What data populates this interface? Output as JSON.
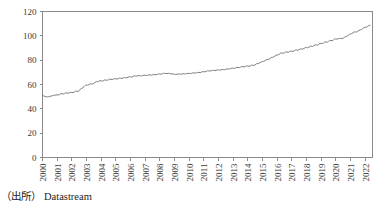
{
  "source_note": {
    "label": "（出所）",
    "text": "Datastream"
  },
  "chart_data": {
    "type": "line",
    "title": "",
    "xlabel": "",
    "ylabel": "",
    "ylim": [
      0,
      120
    ],
    "yticks": [
      0,
      20,
      40,
      60,
      80,
      100,
      120
    ],
    "ytick_labels": [
      "0",
      "20",
      "40",
      "60",
      "80",
      "100",
      "120"
    ],
    "xlim": [
      2000,
      2022.5
    ],
    "xticks": [
      2000,
      2001,
      2002,
      2003,
      2004,
      2005,
      2006,
      2007,
      2008,
      2009,
      2010,
      2011,
      2012,
      2013,
      2014,
      2015,
      2016,
      2017,
      2018,
      2019,
      2020,
      2021,
      2022
    ],
    "xtick_labels": [
      "2000",
      "2001",
      "2002",
      "2003",
      "2004",
      "2005",
      "2006",
      "2007",
      "2008",
      "2009",
      "2010",
      "2011",
      "2012",
      "2013",
      "2014",
      "2015",
      "2016",
      "2017",
      "2018",
      "2019",
      "2020",
      "2021",
      "2022"
    ],
    "xtick_rotation": 90,
    "grid": false,
    "legend": null,
    "line_color": "#6e6e6e",
    "axis_color": "#8a8a8a",
    "series": [
      {
        "name": "index",
        "x": [
          2000.0,
          2000.08,
          2000.17,
          2000.25,
          2000.33,
          2000.42,
          2000.5,
          2000.58,
          2000.67,
          2000.75,
          2000.83,
          2000.92,
          2001.0,
          2001.08,
          2001.17,
          2001.25,
          2001.33,
          2001.42,
          2001.5,
          2001.58,
          2001.67,
          2001.75,
          2001.83,
          2001.92,
          2002.0,
          2002.08,
          2002.17,
          2002.25,
          2002.33,
          2002.42,
          2002.5,
          2002.58,
          2002.67,
          2002.75,
          2002.83,
          2002.92,
          2003.0,
          2003.08,
          2003.17,
          2003.25,
          2003.33,
          2003.42,
          2003.5,
          2003.58,
          2003.67,
          2003.75,
          2003.83,
          2003.92,
          2004.0,
          2004.08,
          2004.17,
          2004.25,
          2004.33,
          2004.42,
          2004.5,
          2004.58,
          2004.67,
          2004.75,
          2004.83,
          2004.92,
          2005.0,
          2005.08,
          2005.17,
          2005.25,
          2005.33,
          2005.42,
          2005.5,
          2005.58,
          2005.67,
          2005.75,
          2005.83,
          2005.92,
          2006.0,
          2006.08,
          2006.17,
          2006.25,
          2006.33,
          2006.42,
          2006.5,
          2006.58,
          2006.67,
          2006.75,
          2006.83,
          2006.92,
          2007.0,
          2007.08,
          2007.17,
          2007.25,
          2007.33,
          2007.42,
          2007.5,
          2007.58,
          2007.67,
          2007.75,
          2007.83,
          2007.92,
          2008.0,
          2008.08,
          2008.17,
          2008.25,
          2008.33,
          2008.42,
          2008.5,
          2008.58,
          2008.67,
          2008.75,
          2008.83,
          2008.92,
          2009.0,
          2009.08,
          2009.17,
          2009.25,
          2009.33,
          2009.42,
          2009.5,
          2009.58,
          2009.67,
          2009.75,
          2009.83,
          2009.92,
          2010.0,
          2010.08,
          2010.17,
          2010.25,
          2010.33,
          2010.42,
          2010.5,
          2010.58,
          2010.67,
          2010.75,
          2010.83,
          2010.92,
          2011.0,
          2011.08,
          2011.17,
          2011.25,
          2011.33,
          2011.42,
          2011.5,
          2011.58,
          2011.67,
          2011.75,
          2011.83,
          2011.92,
          2012.0,
          2012.08,
          2012.17,
          2012.25,
          2012.33,
          2012.42,
          2012.5,
          2012.58,
          2012.67,
          2012.75,
          2012.83,
          2012.92,
          2013.0,
          2013.08,
          2013.17,
          2013.25,
          2013.33,
          2013.42,
          2013.5,
          2013.58,
          2013.67,
          2013.75,
          2013.83,
          2013.92,
          2014.0,
          2014.08,
          2014.17,
          2014.25,
          2014.33,
          2014.42,
          2014.5,
          2014.58,
          2014.67,
          2014.75,
          2014.83,
          2014.92,
          2015.0,
          2015.08,
          2015.17,
          2015.25,
          2015.33,
          2015.42,
          2015.5,
          2015.58,
          2015.67,
          2015.75,
          2015.83,
          2015.92,
          2016.0,
          2016.08,
          2016.17,
          2016.25,
          2016.33,
          2016.42,
          2016.5,
          2016.58,
          2016.67,
          2016.75,
          2016.83,
          2016.92,
          2017.0,
          2017.08,
          2017.17,
          2017.25,
          2017.33,
          2017.42,
          2017.5,
          2017.58,
          2017.67,
          2017.75,
          2017.83,
          2017.92,
          2018.0,
          2018.08,
          2018.17,
          2018.25,
          2018.33,
          2018.42,
          2018.5,
          2018.58,
          2018.67,
          2018.75,
          2018.83,
          2018.92,
          2019.0,
          2019.08,
          2019.17,
          2019.25,
          2019.33,
          2019.42,
          2019.5,
          2019.58,
          2019.67,
          2019.75,
          2019.83,
          2019.92,
          2020.0,
          2020.08,
          2020.17,
          2020.25,
          2020.33,
          2020.42,
          2020.5,
          2020.58,
          2020.67,
          2020.75,
          2020.83,
          2020.92,
          2021.0,
          2021.08,
          2021.17,
          2021.25,
          2021.33,
          2021.42,
          2021.5,
          2021.58,
          2021.67,
          2021.75,
          2021.83,
          2021.92,
          2022.0,
          2022.08,
          2022.17,
          2022.25,
          2022.33
        ],
        "values": [
          51.0,
          50.6,
          50.2,
          49.9,
          49.8,
          49.9,
          50.2,
          50.5,
          50.8,
          51.0,
          51.2,
          51.4,
          51.5,
          51.4,
          51.7,
          52.6,
          52.4,
          52.2,
          52.5,
          53.2,
          53.0,
          52.8,
          53.1,
          53.6,
          53.4,
          53.3,
          53.8,
          54.6,
          54.4,
          54.3,
          55.0,
          56.2,
          56.8,
          57.3,
          58.2,
          59.3,
          59.6,
          59.5,
          59.9,
          60.6,
          60.5,
          60.4,
          60.9,
          61.8,
          62.3,
          62.2,
          62.6,
          63.3,
          62.9,
          62.8,
          63.2,
          63.8,
          63.6,
          63.5,
          63.9,
          64.5,
          64.2,
          64.1,
          64.4,
          64.9,
          64.6,
          64.5,
          64.8,
          65.3,
          65.1,
          65.0,
          65.3,
          65.8,
          65.6,
          65.5,
          65.9,
          66.5,
          66.2,
          66.1,
          66.5,
          67.2,
          67.0,
          66.9,
          67.1,
          67.4,
          67.2,
          67.1,
          67.3,
          67.7,
          67.5,
          67.4,
          67.6,
          68.0,
          67.8,
          67.7,
          67.9,
          68.3,
          68.1,
          68.0,
          68.3,
          68.8,
          68.6,
          68.5,
          68.8,
          69.3,
          69.1,
          69.0,
          69.1,
          69.3,
          69.0,
          68.8,
          68.7,
          68.6,
          68.4,
          68.3,
          68.4,
          68.7,
          68.6,
          68.5,
          68.6,
          68.9,
          68.8,
          68.7,
          68.9,
          69.2,
          69.1,
          69.0,
          69.2,
          69.6,
          69.5,
          69.4,
          69.6,
          70.0,
          69.9,
          69.8,
          70.1,
          70.6,
          70.5,
          70.4,
          70.7,
          71.3,
          71.2,
          71.1,
          71.3,
          71.7,
          71.5,
          71.4,
          71.6,
          72.1,
          71.9,
          71.8,
          72.0,
          72.4,
          72.3,
          72.2,
          72.4,
          72.9,
          72.8,
          72.7,
          73.0,
          73.6,
          73.4,
          73.3,
          73.6,
          74.2,
          74.0,
          73.9,
          74.2,
          74.8,
          74.6,
          74.5,
          74.8,
          75.3,
          75.1,
          75.0,
          75.3,
          75.9,
          75.8,
          75.7,
          76.2,
          77.0,
          77.2,
          77.4,
          77.9,
          78.6,
          78.8,
          79.0,
          79.5,
          80.3,
          80.5,
          80.7,
          81.2,
          82.0,
          82.3,
          82.6,
          83.2,
          84.0,
          84.3,
          84.5,
          85.1,
          86.0,
          85.8,
          85.7,
          86.1,
          86.8,
          86.6,
          86.5,
          86.9,
          87.5,
          87.4,
          87.3,
          87.7,
          88.4,
          88.3,
          88.2,
          88.6,
          89.3,
          89.2,
          89.1,
          89.6,
          90.4,
          90.3,
          90.2,
          90.7,
          91.5,
          91.4,
          91.3,
          91.8,
          92.6,
          92.5,
          92.4,
          92.9,
          93.8,
          93.7,
          93.6,
          94.1,
          95.0,
          94.9,
          94.8,
          95.3,
          96.2,
          96.1,
          96.0,
          96.6,
          97.5,
          97.4,
          97.3,
          97.6,
          98.0,
          97.8,
          97.7,
          98.1,
          98.8,
          99.2,
          99.6,
          100.3,
          101.2,
          101.5,
          101.8,
          102.4,
          103.3,
          103.2,
          103.1,
          103.7,
          104.6,
          104.9,
          105.2,
          105.9,
          106.8,
          107.0,
          107.2,
          107.8,
          108.5,
          108.7
        ]
      }
    ]
  }
}
